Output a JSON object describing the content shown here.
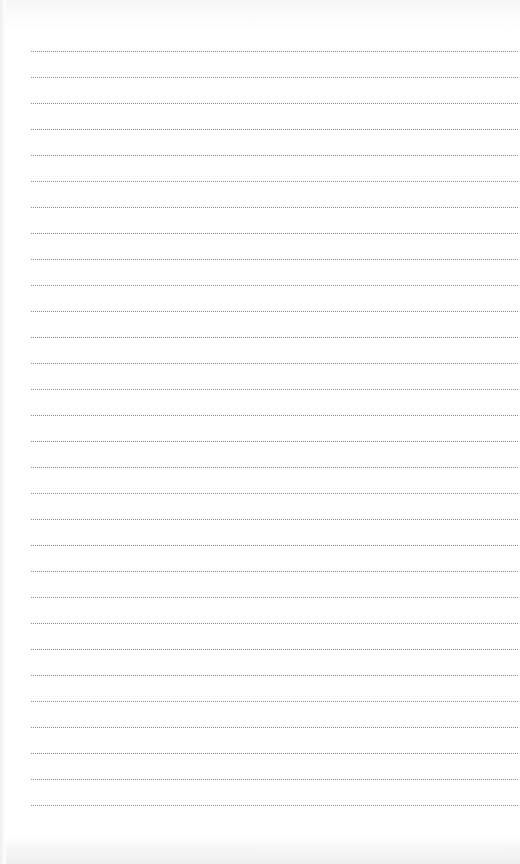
{
  "page": {
    "type": "ruled-notebook-page",
    "background_color": "#ffffff",
    "line_color": "#8a8a8a",
    "line_style": "dotted",
    "line_count": 30,
    "first_line_y": 51,
    "line_spacing": 26,
    "line_left_x": 31,
    "text_lines": [
      "",
      "",
      "",
      "",
      "",
      "",
      "",
      "",
      "",
      "",
      "",
      "",
      "",
      "",
      "",
      "",
      "",
      "",
      "",
      "",
      "",
      "",
      "",
      "",
      "",
      "",
      "",
      "",
      "",
      ""
    ]
  }
}
